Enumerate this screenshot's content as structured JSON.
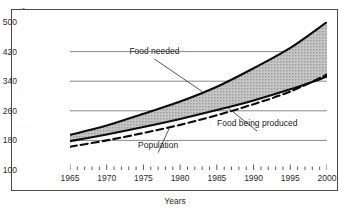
{
  "chart_data": {
    "type": "area",
    "title": "",
    "xlabel": "Years",
    "ylabel": "World population in millions",
    "xlim": [
      1965,
      2000
    ],
    "ylim": [
      100,
      500
    ],
    "xticks": [
      1965,
      1970,
      1975,
      1980,
      1985,
      1990,
      1995,
      2000
    ],
    "yticks": [
      100,
      180,
      260,
      340,
      420,
      500
    ],
    "minor_xtick_interval": 1,
    "grid": "horizontal",
    "legend": "inline-annotations",
    "x": [
      1965,
      1970,
      1975,
      1980,
      1985,
      1990,
      1995,
      2000
    ],
    "series": [
      {
        "name": "Food needed",
        "style": "solid",
        "values": [
          195,
          220,
          252,
          285,
          325,
          375,
          430,
          500
        ]
      },
      {
        "name": "Food being produced",
        "style": "solid",
        "values": [
          178,
          196,
          216,
          238,
          262,
          288,
          318,
          352
        ]
      },
      {
        "name": "Population",
        "style": "dashed",
        "values": [
          163,
          180,
          200,
          222,
          248,
          278,
          312,
          358
        ]
      }
    ],
    "shaded_band": {
      "between": [
        "Food needed",
        "Food being produced"
      ],
      "fill": "#b5b5b5",
      "hatch": "dotted-grey"
    },
    "annotations": [
      {
        "text": "Food needed",
        "x_text": 1976.5,
        "y_text": 408,
        "x_point": 1983.0,
        "y_point": 312
      },
      {
        "text": "Food being produced",
        "x_text": 1990.5,
        "y_text": 213,
        "x_point": 1986.5,
        "y_point": 268
      },
      {
        "text": "Population",
        "x_text": 1977.0,
        "y_text": 155,
        "x_point": 1978.5,
        "y_point": 212
      }
    ]
  },
  "axis": {
    "ylabel": "World population in millions",
    "xlabel": "Years",
    "yticks": [
      "500",
      "420",
      "340",
      "260",
      "180",
      "100"
    ],
    "xticks": [
      "1965",
      "1970",
      "1975",
      "1980",
      "1985",
      "1990",
      "1995",
      "2000"
    ]
  },
  "annotations": {
    "food_needed": "Food needed",
    "food_being_produced": "Food being produced",
    "population": "Population"
  },
  "colors": {
    "frame": "#4a4a4a",
    "grid": "#7a7a7a",
    "line": "#0d0d0d",
    "band_fill": "#b9b9b9",
    "background": "#ffffff"
  }
}
